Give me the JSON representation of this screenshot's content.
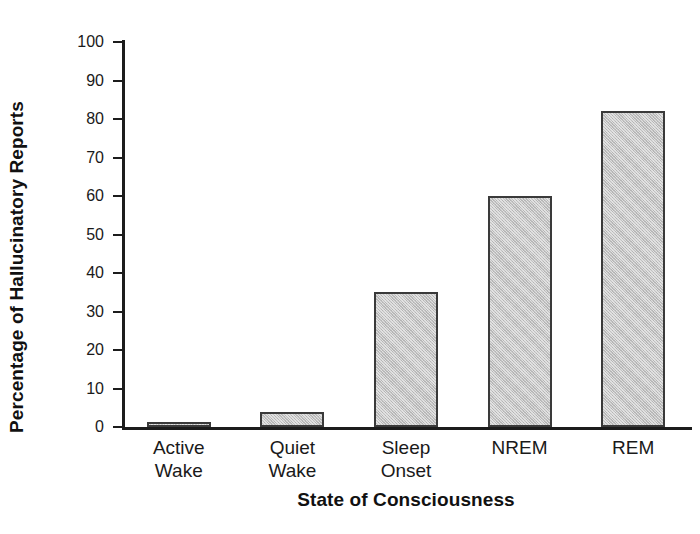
{
  "chart_data": {
    "type": "bar",
    "title": "",
    "xlabel": "State of Consciousness",
    "ylabel": "Percentage of Hallucinatory Reports",
    "categories": [
      "Active\nWake",
      "Quiet\nWake",
      "Sleep\nOnset",
      "NREM",
      "REM"
    ],
    "values": [
      1,
      4,
      35,
      60,
      82
    ],
    "ylim": [
      0,
      100
    ],
    "yticks": [
      0,
      10,
      20,
      30,
      40,
      50,
      60,
      70,
      80,
      90,
      100
    ],
    "ytick_labels": [
      "0",
      "10",
      "20",
      "30",
      "40",
      "50",
      "60",
      "70",
      "80",
      "90",
      "100"
    ],
    "grid": false,
    "legend": false,
    "bar_fill_color": "#c2c2c2",
    "bar_edge_color": "#3a3a3a",
    "axis_color": "#1c1c1c",
    "background_color": "#ffffff"
  }
}
